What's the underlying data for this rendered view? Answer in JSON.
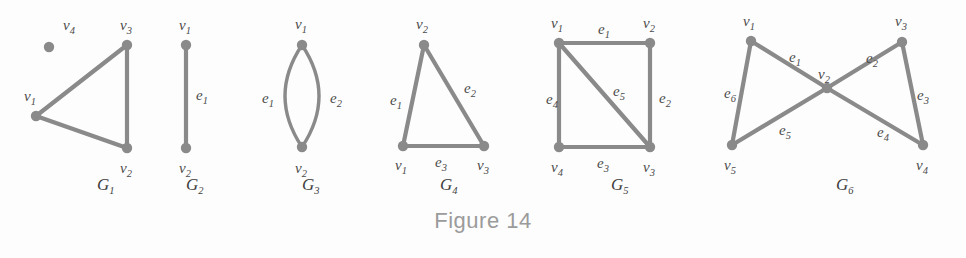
{
  "figure": {
    "caption": "Figure 14",
    "vertex_color": "#8a8a8a",
    "edge_color": "#8a8a8a",
    "label_color": "#4a4a4a",
    "caption_color": "#9b9b9b",
    "background": "#fdfdfd"
  },
  "graphs": [
    {
      "id": "G1",
      "name": "G",
      "sub": "1",
      "label_x": 97,
      "label_y": 190,
      "vertices": [
        {
          "id": "v1",
          "name": "v",
          "sub": "1",
          "cx": 36,
          "cy": 116,
          "lx": 24,
          "ly": 101
        },
        {
          "id": "v2",
          "name": "v",
          "sub": "2",
          "cx": 127,
          "cy": 148,
          "lx": 120,
          "ly": 173
        },
        {
          "id": "v3",
          "name": "v",
          "sub": "3",
          "cx": 127,
          "cy": 45,
          "lx": 120,
          "ly": 30
        },
        {
          "id": "v4",
          "name": "v",
          "sub": "4",
          "cx": 49,
          "cy": 47,
          "lx": 63,
          "ly": 30
        }
      ],
      "edges": [
        {
          "id": "a",
          "from": "v1",
          "to": "v3",
          "label": null
        },
        {
          "id": "b",
          "from": "v1",
          "to": "v2",
          "label": null
        },
        {
          "id": "c",
          "from": "v3",
          "to": "v2",
          "label": null
        }
      ]
    },
    {
      "id": "G2",
      "name": "G",
      "sub": "2",
      "label_x": 186,
      "label_y": 190,
      "vertices": [
        {
          "id": "v1",
          "name": "v",
          "sub": "1",
          "cx": 186,
          "cy": 45,
          "lx": 179,
          "ly": 30
        },
        {
          "id": "v2",
          "name": "v",
          "sub": "2",
          "cx": 186,
          "cy": 148,
          "lx": 179,
          "ly": 173
        }
      ],
      "edges": [
        {
          "id": "e1",
          "from": "v1",
          "to": "v2",
          "label": "e",
          "label_sub": "1",
          "lx": 196,
          "ly": 100
        }
      ]
    },
    {
      "id": "G3",
      "name": "G",
      "sub": "3",
      "label_x": 302,
      "label_y": 190,
      "vertices": [
        {
          "id": "v1",
          "name": "v",
          "sub": "1",
          "cx": 302,
          "cy": 45,
          "lx": 295,
          "ly": 29
        },
        {
          "id": "v2",
          "name": "v",
          "sub": "2",
          "cx": 302,
          "cy": 147,
          "lx": 295,
          "ly": 173
        }
      ],
      "edges": [
        {
          "id": "e1",
          "from": "v1",
          "to": "v2",
          "curve": "left",
          "label": "e",
          "label_sub": "1",
          "lx": 262,
          "ly": 103
        },
        {
          "id": "e2",
          "from": "v1",
          "to": "v2",
          "curve": "right",
          "label": "e",
          "label_sub": "2",
          "lx": 330,
          "ly": 103
        }
      ]
    },
    {
      "id": "G4",
      "name": "G",
      "sub": "4",
      "label_x": 440,
      "label_y": 190,
      "vertices": [
        {
          "id": "v1",
          "name": "v",
          "sub": "1",
          "cx": 403,
          "cy": 146,
          "lx": 395,
          "ly": 170
        },
        {
          "id": "v2",
          "name": "v",
          "sub": "2",
          "cx": 424,
          "cy": 45,
          "lx": 416,
          "ly": 29
        },
        {
          "id": "v3",
          "name": "v",
          "sub": "3",
          "cx": 484,
          "cy": 146,
          "lx": 477,
          "ly": 170
        }
      ],
      "edges": [
        {
          "id": "e1",
          "from": "v1",
          "to": "v2",
          "label": "e",
          "label_sub": "1",
          "lx": 390,
          "ly": 105
        },
        {
          "id": "e2",
          "from": "v2",
          "to": "v3",
          "label": "e",
          "label_sub": "2",
          "lx": 464,
          "ly": 93
        },
        {
          "id": "e3",
          "from": "v1",
          "to": "v3",
          "label": "e",
          "label_sub": "3",
          "lx": 435,
          "ly": 167
        }
      ]
    },
    {
      "id": "G5",
      "name": "G",
      "sub": "5",
      "label_x": 611,
      "label_y": 190,
      "vertices": [
        {
          "id": "v1",
          "name": "v",
          "sub": "1",
          "cx": 559,
          "cy": 43,
          "lx": 551,
          "ly": 28
        },
        {
          "id": "v2",
          "name": "v",
          "sub": "2",
          "cx": 650,
          "cy": 43,
          "lx": 643,
          "ly": 28
        },
        {
          "id": "v3",
          "name": "v",
          "sub": "3",
          "cx": 650,
          "cy": 147,
          "lx": 643,
          "ly": 172
        },
        {
          "id": "v4",
          "name": "v",
          "sub": "4",
          "cx": 559,
          "cy": 147,
          "lx": 551,
          "ly": 172
        }
      ],
      "edges": [
        {
          "id": "e1",
          "from": "v1",
          "to": "v2",
          "label": "e",
          "label_sub": "1",
          "lx": 598,
          "ly": 34
        },
        {
          "id": "e2",
          "from": "v2",
          "to": "v3",
          "label": "e",
          "label_sub": "2",
          "lx": 659,
          "ly": 103
        },
        {
          "id": "e3",
          "from": "v4",
          "to": "v3",
          "label": "e",
          "label_sub": "3",
          "lx": 597,
          "ly": 168
        },
        {
          "id": "e4",
          "from": "v1",
          "to": "v4",
          "label": "e",
          "label_sub": "4",
          "lx": 546,
          "ly": 104
        },
        {
          "id": "e5",
          "from": "v1",
          "to": "v3",
          "label": "e",
          "label_sub": "5",
          "lx": 613,
          "ly": 96
        }
      ]
    },
    {
      "id": "G6",
      "name": "G",
      "sub": "6",
      "label_x": 836,
      "label_y": 190,
      "vertices": [
        {
          "id": "v1",
          "name": "v",
          "sub": "1",
          "cx": 751,
          "cy": 41,
          "lx": 743,
          "ly": 26
        },
        {
          "id": "v2",
          "name": "v",
          "sub": "2",
          "cx": 827,
          "cy": 88,
          "lx": 818,
          "ly": 79
        },
        {
          "id": "v3",
          "name": "v",
          "sub": "3",
          "cx": 902,
          "cy": 42,
          "lx": 895,
          "ly": 26
        },
        {
          "id": "v4",
          "name": "v",
          "sub": "4",
          "cx": 923,
          "cy": 145,
          "lx": 916,
          "ly": 170
        },
        {
          "id": "v5",
          "name": "v",
          "sub": "5",
          "cx": 732,
          "cy": 145,
          "lx": 724,
          "ly": 170
        }
      ],
      "edges": [
        {
          "id": "e1",
          "from": "v1",
          "to": "v2",
          "label": "e",
          "label_sub": "1",
          "lx": 789,
          "ly": 62
        },
        {
          "id": "e2",
          "from": "v2",
          "to": "v3",
          "label": "e",
          "label_sub": "2",
          "lx": 866,
          "ly": 63
        },
        {
          "id": "e3",
          "from": "v3",
          "to": "v4",
          "label": "e",
          "label_sub": "3",
          "lx": 917,
          "ly": 100
        },
        {
          "id": "e4",
          "from": "v2",
          "to": "v4",
          "label": "e",
          "label_sub": "4",
          "lx": 877,
          "ly": 137
        },
        {
          "id": "e5",
          "from": "v2",
          "to": "v5",
          "label": "e",
          "label_sub": "5",
          "lx": 779,
          "ly": 135
        },
        {
          "id": "e6",
          "from": "v1",
          "to": "v5",
          "label": "e",
          "label_sub": "6",
          "lx": 724,
          "ly": 98
        }
      ]
    }
  ]
}
